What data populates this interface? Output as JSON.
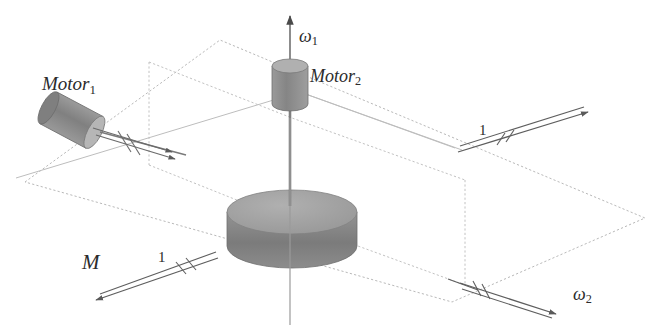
{
  "figure": {
    "kind": "technical-line-diagram",
    "background_color": "#ffffff",
    "ink_color": "#3a3a3a",
    "frame_color": "#b9b9b9"
  },
  "labels": {
    "motor1": {
      "base": "Motor",
      "sub": "1"
    },
    "motor2": {
      "base": "Motor",
      "sub": "2"
    },
    "omega1": {
      "base": "ω",
      "sub": "1"
    },
    "omega2": {
      "base": "ω",
      "sub": "2"
    },
    "moment": {
      "base": "M",
      "sub": ""
    },
    "bearing_a": {
      "base": "1",
      "sub": ""
    },
    "bearing_b": {
      "base": "1",
      "sub": ""
    }
  },
  "parts": {
    "outer_frame": {
      "name": "outer-gimbal-frame",
      "style": "dashed",
      "color": "#b9b9b9",
      "corners": [
        [
          25,
          182
        ],
        [
          220,
          40
        ],
        [
          645,
          218
        ],
        [
          452,
          302
        ]
      ]
    },
    "inner_frame": {
      "name": "inner-gimbal-frame",
      "style": "dashed",
      "color": "#c2c2c2",
      "corners": [
        [
          149,
          62
        ],
        [
          322,
          128
        ],
        [
          465,
          180
        ],
        [
          465,
          285
        ],
        [
          149,
          165
        ]
      ]
    },
    "motor1_body": {
      "name": "motor-1-cylinder",
      "color_body": "#8d8d8d",
      "color_cap": "#b3b3b3",
      "center": [
        75,
        122
      ],
      "tilt_deg": 28
    },
    "motor2_body": {
      "name": "motor-2-cylinder",
      "color_body": "#8a8a8a",
      "color_cap": "#b5b5b5",
      "center": [
        290,
        84
      ]
    },
    "flywheel_disk": {
      "name": "flywheel-disk",
      "color_top": "#a0a0a0",
      "color_side": "#7e7e7e",
      "center": [
        292,
        212
      ],
      "rx": 65,
      "ry": 22,
      "thickness": 34
    },
    "vertical_axis": {
      "name": "omega-1-axis",
      "from": [
        290,
        212
      ],
      "to": [
        290,
        14
      ],
      "arrow": "up"
    }
  },
  "vectors": [
    {
      "name": "moment-vector-M",
      "label": "M",
      "hatch_marks": 2,
      "direction": "down-left"
    },
    {
      "name": "omega-2-vector",
      "label": "ω₂",
      "hatch_marks": 2,
      "direction": "down-right"
    },
    {
      "name": "bearing-axis-right",
      "label": "1",
      "hatch_marks": 2,
      "direction": "up-right"
    },
    {
      "name": "motor-1-shaft-vector",
      "label": "",
      "hatch_marks": 2,
      "direction": "down-right"
    }
  ]
}
